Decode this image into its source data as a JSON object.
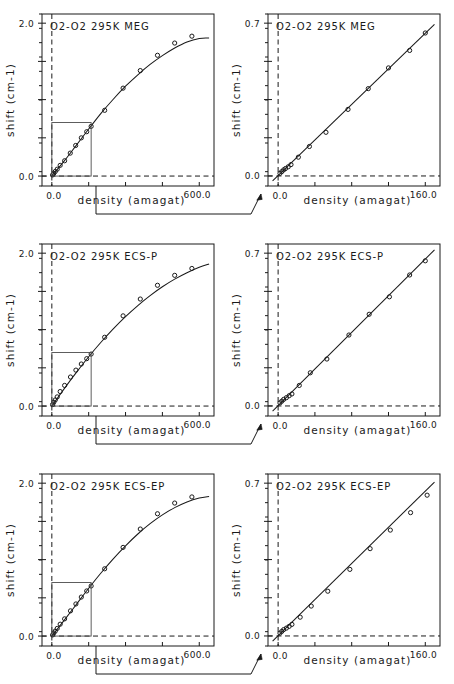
{
  "figure": {
    "name": "o2-o2-pressure-shift-figure",
    "width": 454,
    "height": 684,
    "background": "#ffffff",
    "ink_color": "#1a1a1a",
    "rows": 3,
    "columns": 2,
    "description_axis_x": "density (amagat)",
    "description_axis_y": "shift  (cm-1)"
  },
  "axis_labels": {
    "x_title": "density (amagat)",
    "y_title": "shift  (cm-1)",
    "full_x_min_label": "0.0",
    "full_x_max_label": "600.0",
    "zoom_x_min_label": "0.0",
    "zoom_x_max_label": "160.0",
    "full_y_min_label": "0.0",
    "full_y_max_label": "2.0",
    "zoom_y_min_label": "0.0",
    "zoom_y_max_label": "0.7"
  },
  "panels": [
    {
      "id": "meg-full",
      "title": "O2-O2  295K  MEG",
      "kind": "full-range",
      "row": 1,
      "column": 1,
      "has_inset_box": true,
      "inset_box_x_range": [
        0.0,
        160.0
      ],
      "inset_box_y_range": [
        0.0,
        0.7
      ]
    },
    {
      "id": "meg-zoom",
      "title": "O2-O2  295K  MEG",
      "kind": "zoom-range",
      "row": 1,
      "column": 2,
      "has_inset_box": false
    },
    {
      "id": "ecsp-full",
      "title": "O2-O2  295K  ECS-P",
      "kind": "full-range",
      "row": 2,
      "column": 1,
      "has_inset_box": true,
      "inset_box_x_range": [
        0.0,
        160.0
      ],
      "inset_box_y_range": [
        0.0,
        0.7
      ]
    },
    {
      "id": "ecsp-zoom",
      "title": "O2-O2  295K  ECS-P",
      "kind": "zoom-range",
      "row": 2,
      "column": 2,
      "has_inset_box": false
    },
    {
      "id": "ecsep-full",
      "title": "O2-O2  295K  ECS-EP",
      "kind": "full-range",
      "row": 3,
      "column": 1,
      "has_inset_box": true,
      "inset_box_x_range": [
        0.0,
        160.0
      ],
      "inset_box_y_range": [
        0.0,
        0.7
      ]
    },
    {
      "id": "ecsep-zoom",
      "title": "O2-O2  295K  ECS-EP",
      "kind": "zoom-range",
      "row": 3,
      "column": 2,
      "has_inset_box": false
    }
  ],
  "chart_data": [
    {
      "id": "meg-full",
      "type": "scatter",
      "title": "O2-O2  295K  MEG",
      "xlabel": "density (amagat)",
      "ylabel": "shift  (cm-1)",
      "xlim": [
        -40,
        660
      ],
      "ylim": [
        -0.13,
        2.12
      ],
      "xticks": [
        0.0,
        150.0,
        300.0,
        450.0,
        600.0
      ],
      "xticklabels": [
        "0.0",
        "",
        "",
        "",
        "600.0"
      ],
      "yticks": [
        0.0,
        0.5,
        1.0,
        1.5,
        2.0
      ],
      "yticklabels": [
        "0.0",
        "",
        "",
        "",
        "2.0"
      ],
      "grid": false,
      "legend": "none",
      "reference_lines": {
        "x": 0.0,
        "y": 0.0,
        "style": "dashed"
      },
      "series": [
        {
          "name": "measured shift",
          "marker": "open-circle",
          "x": [
            3,
            8,
            14,
            22,
            34,
            52,
            75,
            97,
            120,
            142,
            160,
            215,
            290,
            360,
            430,
            500,
            570
          ],
          "y": [
            0.015,
            0.035,
            0.06,
            0.09,
            0.14,
            0.2,
            0.3,
            0.4,
            0.5,
            0.58,
            0.65,
            0.86,
            1.15,
            1.38,
            1.58,
            1.74,
            1.83
          ]
        },
        {
          "name": "model curve",
          "style": "solid-line",
          "x": [
            0,
            50,
            100,
            150,
            200,
            250,
            300,
            350,
            400,
            450,
            500,
            550,
            600,
            640
          ],
          "y": [
            0.0,
            0.195,
            0.405,
            0.615,
            0.82,
            1.005,
            1.175,
            1.325,
            1.46,
            1.575,
            1.675,
            1.755,
            1.8,
            1.805
          ]
        }
      ]
    },
    {
      "id": "meg-zoom",
      "type": "scatter",
      "title": "O2-O2  295K  MEG",
      "xlabel": "density (amagat)",
      "ylabel": "shift  (cm-1)",
      "xlim": [
        -11,
        176
      ],
      "ylim": [
        -0.046,
        0.742
      ],
      "xticks": [
        0.0,
        40.0,
        80.0,
        120.0,
        160.0
      ],
      "xticklabels": [
        "0.0",
        "",
        "",
        "",
        "160.0"
      ],
      "yticks": [
        0.0,
        0.175,
        0.35,
        0.525,
        0.7
      ],
      "yticklabels": [
        "0.0",
        "",
        "",
        "",
        "0.7"
      ],
      "grid": false,
      "legend": "none",
      "reference_lines": {
        "x": 0.0,
        "y": 0.0,
        "style": "dashed"
      },
      "series": [
        {
          "name": "measured shift",
          "marker": "open-circle",
          "x": [
            2,
            4,
            6,
            8,
            11,
            14,
            22,
            34,
            52,
            76,
            98,
            120,
            143,
            160
          ],
          "y": [
            0.012,
            0.02,
            0.028,
            0.034,
            0.042,
            0.052,
            0.086,
            0.135,
            0.2,
            0.305,
            0.4,
            0.495,
            0.575,
            0.655
          ]
        },
        {
          "name": "model line",
          "style": "solid-line",
          "x": [
            -6,
            170
          ],
          "y": [
            -0.022,
            0.695
          ]
        }
      ]
    },
    {
      "id": "ecsp-full",
      "type": "scatter",
      "title": "O2-O2  295K  ECS-P",
      "xlabel": "density (amagat)",
      "ylabel": "shift  (cm-1)",
      "xlim": [
        -40,
        660
      ],
      "ylim": [
        -0.13,
        2.12
      ],
      "xticks": [
        0.0,
        150.0,
        300.0,
        450.0,
        600.0
      ],
      "xticklabels": [
        "0.0",
        "",
        "",
        "",
        "600.0"
      ],
      "yticks": [
        0.0,
        0.5,
        1.0,
        1.5,
        2.0
      ],
      "yticklabels": [
        "0.0",
        "",
        "",
        "",
        "2.0"
      ],
      "grid": false,
      "legend": "none",
      "reference_lines": {
        "x": 0.0,
        "y": 0.0,
        "style": "dashed"
      },
      "series": [
        {
          "name": "measured shift",
          "marker": "open-circle",
          "x": [
            3,
            8,
            14,
            22,
            34,
            52,
            76,
            98,
            120,
            142,
            160,
            215,
            290,
            360,
            430,
            500,
            570
          ],
          "y": [
            0.02,
            0.05,
            0.08,
            0.12,
            0.19,
            0.27,
            0.38,
            0.47,
            0.55,
            0.62,
            0.68,
            0.9,
            1.18,
            1.4,
            1.58,
            1.71,
            1.8
          ]
        },
        {
          "name": "model curve",
          "style": "solid-line",
          "x": [
            0,
            50,
            100,
            150,
            200,
            250,
            300,
            350,
            400,
            450,
            500,
            550,
            600,
            640
          ],
          "y": [
            0.0,
            0.225,
            0.44,
            0.645,
            0.835,
            1.01,
            1.17,
            1.315,
            1.445,
            1.56,
            1.66,
            1.745,
            1.815,
            1.86
          ]
        }
      ]
    },
    {
      "id": "ecsp-zoom",
      "type": "scatter",
      "title": "O2-O2  295K  ECS-P",
      "xlabel": "density (amagat)",
      "ylabel": "shift  (cm-1)",
      "xlim": [
        -11,
        176
      ],
      "ylim": [
        -0.046,
        0.742
      ],
      "xticks": [
        0.0,
        40.0,
        80.0,
        120.0,
        160.0
      ],
      "xticklabels": [
        "0.0",
        "",
        "",
        "",
        "160.0"
      ],
      "yticks": [
        0.0,
        0.175,
        0.35,
        0.525,
        0.7
      ],
      "yticklabels": [
        "0.0",
        "",
        "",
        "",
        "0.7"
      ],
      "grid": false,
      "legend": "none",
      "reference_lines": {
        "x": 0.0,
        "y": 0.0,
        "style": "dashed"
      },
      "series": [
        {
          "name": "measured shift",
          "marker": "open-circle",
          "x": [
            2,
            4,
            6,
            9,
            12,
            15,
            23,
            35,
            53,
            77,
            99,
            121,
            143,
            160
          ],
          "y": [
            0.014,
            0.022,
            0.03,
            0.038,
            0.047,
            0.055,
            0.094,
            0.152,
            0.215,
            0.325,
            0.42,
            0.5,
            0.6,
            0.665
          ]
        },
        {
          "name": "model line",
          "style": "solid-line",
          "x": [
            -6,
            170
          ],
          "y": [
            -0.024,
            0.715
          ]
        }
      ]
    },
    {
      "id": "ecsep-full",
      "type": "scatter",
      "title": "O2-O2  295K  ECS-EP",
      "xlabel": "density (amagat)",
      "ylabel": "shift  (cm-1)",
      "xlim": [
        -40,
        660
      ],
      "ylim": [
        -0.13,
        2.12
      ],
      "xticks": [
        0.0,
        150.0,
        300.0,
        450.0,
        600.0
      ],
      "xticklabels": [
        "0.0",
        "",
        "",
        "",
        "600.0"
      ],
      "yticks": [
        0.0,
        0.5,
        1.0,
        1.5,
        2.0
      ],
      "yticklabels": [
        "0.0",
        "",
        "",
        "",
        "2.0"
      ],
      "grid": false,
      "legend": "none",
      "reference_lines": {
        "x": 0.0,
        "y": 0.0,
        "style": "dashed"
      },
      "series": [
        {
          "name": "measured shift",
          "marker": "open-circle",
          "x": [
            3,
            8,
            14,
            22,
            34,
            52,
            76,
            98,
            120,
            142,
            160,
            215,
            290,
            360,
            430,
            500,
            570
          ],
          "y": [
            0.015,
            0.04,
            0.065,
            0.1,
            0.155,
            0.225,
            0.33,
            0.42,
            0.51,
            0.59,
            0.655,
            0.88,
            1.16,
            1.4,
            1.6,
            1.74,
            1.82
          ]
        },
        {
          "name": "model curve",
          "style": "solid-line",
          "x": [
            0,
            50,
            100,
            150,
            200,
            250,
            300,
            350,
            400,
            450,
            500,
            550,
            600,
            640
          ],
          "y": [
            0.0,
            0.205,
            0.415,
            0.625,
            0.825,
            1.01,
            1.18,
            1.335,
            1.47,
            1.585,
            1.68,
            1.755,
            1.805,
            1.825
          ]
        }
      ]
    },
    {
      "id": "ecsep-zoom",
      "type": "scatter",
      "title": "O2-O2  295K  ECS-EP",
      "xlabel": "density (amagat)",
      "ylabel": "shift  (cm-1)",
      "xlim": [
        -11,
        176
      ],
      "ylim": [
        -0.046,
        0.742
      ],
      "xticks": [
        0.0,
        40.0,
        80.0,
        120.0,
        160.0
      ],
      "xticklabels": [
        "0.0",
        "",
        "",
        "",
        "160.0"
      ],
      "yticks": [
        0.0,
        0.175,
        0.35,
        0.525,
        0.7
      ],
      "yticklabels": [
        "0.0",
        "",
        "",
        "",
        "0.7"
      ],
      "grid": false,
      "legend": "none",
      "reference_lines": {
        "x": 0.0,
        "y": 0.0,
        "style": "dashed"
      },
      "series": [
        {
          "name": "measured shift",
          "marker": "open-circle",
          "x": [
            2,
            4,
            6,
            9,
            12,
            15,
            24,
            36,
            54,
            78,
            100,
            122,
            144,
            162
          ],
          "y": [
            0.013,
            0.021,
            0.029,
            0.036,
            0.044,
            0.053,
            0.086,
            0.137,
            0.205,
            0.305,
            0.4,
            0.485,
            0.565,
            0.645
          ]
        },
        {
          "name": "model line",
          "style": "solid-line",
          "x": [
            -6,
            170
          ],
          "y": [
            -0.024,
            0.705
          ]
        }
      ]
    }
  ],
  "connectors": [
    {
      "name": "connector-row-1",
      "from_panel": "meg-full",
      "to_panel": "meg-zoom",
      "arrow": true
    },
    {
      "name": "connector-row-2",
      "from_panel": "ecsp-full",
      "to_panel": "ecsp-zoom",
      "arrow": true
    },
    {
      "name": "connector-row-3",
      "from_panel": "ecsep-full",
      "to_panel": "ecsep-zoom",
      "arrow": true
    }
  ]
}
